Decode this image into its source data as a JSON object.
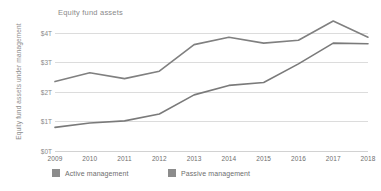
{
  "chart_data": {
    "type": "line",
    "title": "Equity fund assets",
    "xlabel": "",
    "ylabel": "Equity fund assets under management",
    "categories": [
      "2009",
      "2010",
      "2011",
      "2012",
      "2013",
      "2014",
      "2015",
      "2016",
      "2017",
      "2018"
    ],
    "x": [
      2009,
      2010,
      2011,
      2012,
      2013,
      2014,
      2015,
      2016,
      2017,
      2018
    ],
    "ylim": [
      0,
      4.4
    ],
    "yticks": [
      0,
      1,
      2,
      3,
      4
    ],
    "ytick_labels": [
      "$0T",
      "$1T",
      "$2T",
      "$3T",
      "$4T"
    ],
    "grid": true,
    "legend_position": "bottom",
    "series": [
      {
        "name": "Active management",
        "color": "#808080",
        "values": [
          2.35,
          2.65,
          2.45,
          2.7,
          3.6,
          3.85,
          3.65,
          3.75,
          4.4,
          3.85
        ]
      },
      {
        "name": "Passive management",
        "color": "#7a7a7a",
        "values": [
          0.8,
          0.95,
          1.02,
          1.25,
          1.9,
          2.22,
          2.32,
          2.95,
          3.65,
          3.63
        ]
      }
    ]
  },
  "legend": {
    "items": [
      {
        "label": "Active management",
        "color": "#8c8c8c"
      },
      {
        "label": "Passive management",
        "color": "#8c8c8c"
      }
    ]
  },
  "axis": {
    "y_title": "Equity fund assets under management"
  }
}
